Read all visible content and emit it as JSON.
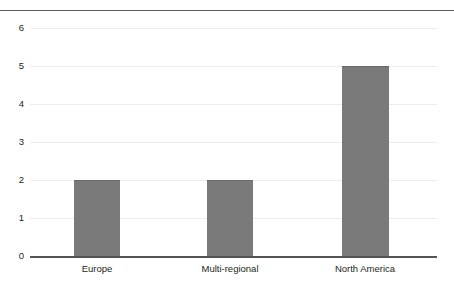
{
  "chart_data": {
    "type": "bar",
    "title": "",
    "subtitle": "",
    "xlabel": "",
    "ylabel": "",
    "categories": [
      "Europe",
      "Multi-regional",
      "North America"
    ],
    "values": [
      2,
      2,
      5
    ],
    "series": [
      {
        "name": "Count",
        "values": [
          2,
          2,
          5
        ]
      }
    ],
    "ylim": [
      0,
      6
    ],
    "yticks": [
      "0",
      "1",
      "2",
      "3",
      "4",
      "5",
      "6"
    ],
    "ytick_values": [
      0,
      1,
      2,
      3,
      4,
      5,
      6
    ],
    "grid": true,
    "grid_axis": "y",
    "legend": false,
    "legend_position": "none",
    "annotations": [],
    "colors": {
      "bar_fill": "#7a7a7a",
      "bar_edge": "#6a6a6a",
      "gridline": "#ededed",
      "axis_line": "#555555",
      "top_rule": "#5e5e5e",
      "text": "#231f20",
      "background": "#ffffff"
    }
  }
}
